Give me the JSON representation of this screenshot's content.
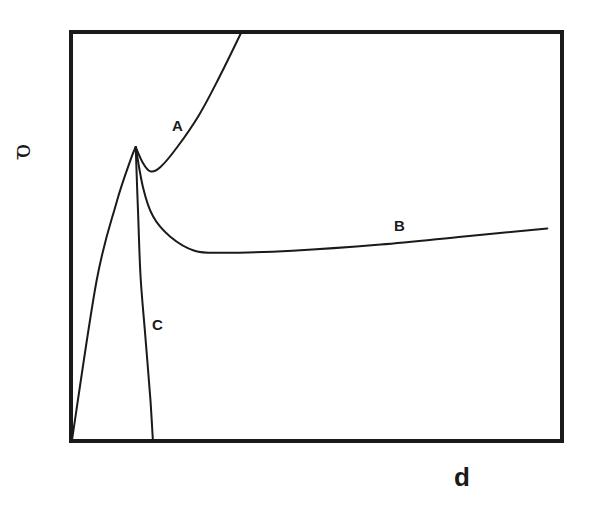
{
  "chart_data": {
    "type": "line",
    "title": "",
    "xlabel": "d",
    "ylabel": "σ",
    "grid": false,
    "legend": "none (curves labeled inline)",
    "axis_ticks": "none",
    "xlim": [
      0,
      1
    ],
    "ylim": [
      0,
      1
    ],
    "shared_rising_branch": {
      "name": "initial rise (common to A, B, C)",
      "points": [
        [
          0.0,
          0.0
        ],
        [
          0.05,
          0.39
        ],
        [
          0.09,
          0.58
        ],
        [
          0.12,
          0.69
        ],
        [
          0.13,
          0.72
        ]
      ]
    },
    "peak": [
      0.13,
      0.72
    ],
    "series": [
      {
        "name": "A",
        "description": "drops to a shallow minimum after the peak, then rises steeply to exceed the plot top",
        "points": [
          [
            0.13,
            0.72
          ],
          [
            0.145,
            0.68
          ],
          [
            0.16,
            0.66
          ],
          [
            0.18,
            0.67
          ],
          [
            0.215,
            0.72
          ],
          [
            0.26,
            0.8
          ],
          [
            0.3,
            0.89
          ],
          [
            0.345,
            1.0
          ]
        ]
      },
      {
        "name": "B",
        "description": "drops after the peak, reaches a plateau minimum, then rises slowly and almost linearly",
        "points": [
          [
            0.13,
            0.72
          ],
          [
            0.145,
            0.62
          ],
          [
            0.165,
            0.55
          ],
          [
            0.2,
            0.5
          ],
          [
            0.25,
            0.465
          ],
          [
            0.31,
            0.46
          ],
          [
            0.45,
            0.465
          ],
          [
            0.63,
            0.48
          ],
          [
            0.8,
            0.5
          ],
          [
            0.97,
            0.52
          ]
        ]
      },
      {
        "name": "C",
        "description": "falls steeply after the peak back to zero stress at small d",
        "points": [
          [
            0.13,
            0.72
          ],
          [
            0.135,
            0.55
          ],
          [
            0.14,
            0.4
          ],
          [
            0.15,
            0.25
          ],
          [
            0.16,
            0.1
          ],
          [
            0.165,
            0.0
          ]
        ]
      }
    ],
    "annotations": [
      {
        "text": "A",
        "x": 0.22,
        "y": 0.77
      },
      {
        "text": "B",
        "x": 0.67,
        "y": 0.52
      },
      {
        "text": "C",
        "x": 0.18,
        "y": 0.28
      }
    ]
  },
  "labels": {
    "y_axis": "σ",
    "x_axis": "d",
    "curve_a": "A",
    "curve_b": "B",
    "curve_c": "C"
  },
  "colors": {
    "ink": "#1a1a1a",
    "background": "#ffffff"
  }
}
